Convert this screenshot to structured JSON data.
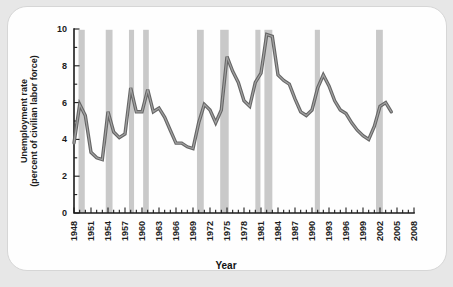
{
  "page": {
    "background_color": "#e7e7e7",
    "card_background_color": "#fefefe"
  },
  "chart_data": {
    "type": "line",
    "title": "",
    "xlabel": "Year",
    "ylabel_line1": "Unemployment rate",
    "ylabel_line2": "(percent of civilian labor force)",
    "x_axis": {
      "min": 1948,
      "max": 2008,
      "major_tick_interval": 3,
      "minor_tick_interval": 1,
      "tick_labels": [
        "1948",
        "1951",
        "1954",
        "1957",
        "1960",
        "1963",
        "1966",
        "1969",
        "1972",
        "1975",
        "1978",
        "1981",
        "1984",
        "1987",
        "1990",
        "1993",
        "1996",
        "1999",
        "2002",
        "2005",
        "2008"
      ]
    },
    "y_axis": {
      "min": 0,
      "max": 10,
      "major_tick_interval": 2,
      "minor_tick_interval": 1,
      "tick_labels": [
        "0",
        "2",
        "4",
        "6",
        "8",
        "10"
      ]
    },
    "grid": false,
    "legend": "none",
    "series": [
      {
        "name": "Unemployment rate",
        "color_outer": "#666666",
        "color_inner": "#a2a2a2",
        "years": [
          1948,
          1949,
          1950,
          1951,
          1952,
          1953,
          1954,
          1955,
          1956,
          1957,
          1958,
          1959,
          1960,
          1961,
          1962,
          1963,
          1964,
          1965,
          1966,
          1967,
          1968,
          1969,
          1970,
          1971,
          1972,
          1973,
          1974,
          1975,
          1976,
          1977,
          1978,
          1979,
          1980,
          1981,
          1982,
          1983,
          1984,
          1985,
          1986,
          1987,
          1988,
          1989,
          1990,
          1991,
          1992,
          1993,
          1994,
          1995,
          1996,
          1997,
          1998,
          1999,
          2000,
          2001,
          2002,
          2003,
          2004
        ],
        "values": [
          3.8,
          5.9,
          5.3,
          3.3,
          3.0,
          2.9,
          5.5,
          4.4,
          4.1,
          4.3,
          6.8,
          5.5,
          5.5,
          6.7,
          5.5,
          5.7,
          5.2,
          4.5,
          3.8,
          3.8,
          3.6,
          3.5,
          4.9,
          5.9,
          5.6,
          4.9,
          5.6,
          8.5,
          7.7,
          7.1,
          6.1,
          5.8,
          7.1,
          7.6,
          9.7,
          9.6,
          7.5,
          7.2,
          7.0,
          6.2,
          5.5,
          5.3,
          5.6,
          6.8,
          7.5,
          6.9,
          6.1,
          5.6,
          5.4,
          4.9,
          4.5,
          4.2,
          4.0,
          4.7,
          5.8,
          6.0,
          5.5
        ]
      }
    ],
    "recession_bands": {
      "color": "#c9c9c9",
      "spans": [
        [
          1948.8,
          1949.9
        ],
        [
          1953.6,
          1954.8
        ],
        [
          1957.7,
          1958.6
        ],
        [
          1960.2,
          1961.2
        ],
        [
          1969.7,
          1970.9
        ],
        [
          1973.8,
          1975.3
        ],
        [
          1980.0,
          1980.9
        ],
        [
          1981.6,
          1983.0
        ],
        [
          1990.5,
          1991.4
        ],
        [
          2001.3,
          2002.5
        ]
      ]
    },
    "axis_color": "#1c1c1c"
  }
}
